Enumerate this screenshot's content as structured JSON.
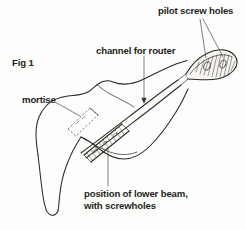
{
  "figure": {
    "id": "Fig 1",
    "background_color": "#fdfdfc",
    "line_color": "#2b2725",
    "text_color": "#231f20"
  },
  "labels": {
    "fig_number": "Fig 1",
    "mortise": "mortise",
    "channel": "channel for router",
    "pilot_holes": "pilot screw holes",
    "lower_beam_line1": "position of lower beam,",
    "lower_beam_line2": "with screwholes"
  },
  "annotations": [
    {
      "name": "mortise",
      "text": "mortise",
      "target": "dashed-rectangle-left",
      "leader": "single"
    },
    {
      "name": "channel-for-router",
      "text": "channel for router",
      "target": "router-channel-lines",
      "leader": "single-with-arrowhead"
    },
    {
      "name": "pilot-screw-holes",
      "text": "pilot screw holes",
      "target": "scroll-end-holes",
      "leader": "double-fan"
    },
    {
      "name": "position-of-lower-beam",
      "text": "position of lower beam, with screwholes",
      "target": "hatched-beam-band",
      "leader": "single"
    }
  ],
  "drawing_parts": [
    {
      "name": "body-outline",
      "description": "long tapering curved blank with hooked foot at lower left"
    },
    {
      "name": "mortise-slot",
      "description": "slanted dashed rectangle near upper left shoulder"
    },
    {
      "name": "router-channel",
      "description": "pair of parallel long lines running diagonally to the scroll"
    },
    {
      "name": "lower-beam-band",
      "description": "slanted cross-hatched band with screwhole marks"
    },
    {
      "name": "scroll-end",
      "description": "hatched crescent horn at upper right with two pilot screw holes"
    }
  ]
}
